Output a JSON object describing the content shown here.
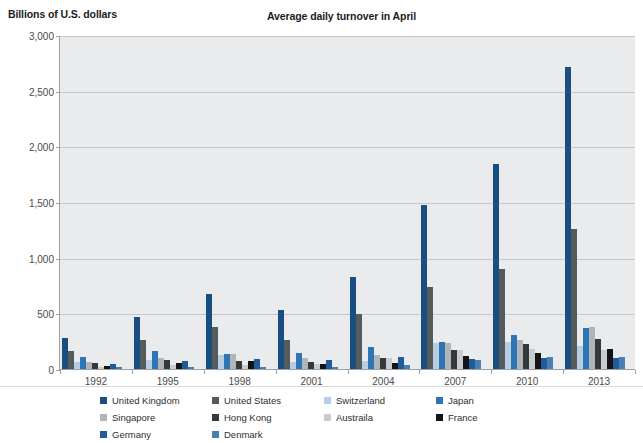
{
  "header": {
    "y_axis_title": "Billions of U.S. dollars",
    "chart_title": "Average daily turnover in April"
  },
  "chart_data": {
    "type": "bar",
    "title": "Average daily turnover in April",
    "xlabel": "",
    "ylabel": "Billions of U.S. dollars",
    "ylim": [
      0,
      3000
    ],
    "yticks": [
      "0",
      "500",
      "1,000",
      "1,500",
      "2,000",
      "2,500",
      "3,000"
    ],
    "ytick_values": [
      0,
      500,
      1000,
      1500,
      2000,
      2500,
      3000
    ],
    "grid": true,
    "legend_position": "bottom",
    "categories": [
      "1992",
      "1995",
      "1998",
      "2001",
      "2004",
      "2007",
      "2010",
      "2013"
    ],
    "series": [
      {
        "name": "United Kingdom",
        "color": "#1a4d80",
        "values": [
          291,
          479,
          685,
          542,
          835,
          1483,
          1854,
          2726
        ]
      },
      {
        "name": "United States",
        "color": "#555a5e",
        "values": [
          167,
          266,
          383,
          273,
          499,
          745,
          904,
          1263
        ]
      },
      {
        "name": "Switzerland",
        "color": "#b9cde0",
        "values": [
          68,
          92,
          139,
          76,
          79,
          242,
          249,
          216
        ]
      },
      {
        "name": "Japan",
        "color": "#2e75b6",
        "values": [
          120,
          168,
          146,
          153,
          207,
          250,
          312,
          374
        ]
      },
      {
        "name": "Singapore",
        "color": "#b2b5b8",
        "values": [
          76,
          107,
          145,
          104,
          134,
          242,
          266,
          383
        ]
      },
      {
        "name": "Hong Kong",
        "color": "#36393c",
        "values": [
          61,
          91,
          80,
          68,
          106,
          181,
          238,
          275
        ]
      },
      {
        "name": "Austraila",
        "color": "#c9ccce",
        "values": [
          30,
          41,
          48,
          54,
          107,
          176,
          192,
          182
        ]
      },
      {
        "name": "France",
        "color": "#121415",
        "values": [
          36,
          62,
          78,
          50,
          67,
          127,
          152,
          190
        ]
      },
      {
        "name": "Germany",
        "color": "#1f5c99",
        "values": [
          57,
          79,
          100,
          91,
          120,
          101,
          109,
          111
        ]
      },
      {
        "name": "Denmark",
        "color": "#4a7fb5",
        "values": [
          31,
          31,
          28,
          24,
          42,
          88,
          120,
          117
        ]
      }
    ]
  },
  "legend": {
    "items": [
      {
        "label": "United Kingdom",
        "color": "#1a4d80"
      },
      {
        "label": "United States",
        "color": "#555a5e"
      },
      {
        "label": "Switzerland",
        "color": "#b9cde0"
      },
      {
        "label": "Japan",
        "color": "#2e75b6"
      },
      {
        "label": "Singapore",
        "color": "#b2b5b8"
      },
      {
        "label": "Hong Kong",
        "color": "#36393c"
      },
      {
        "label": "Austraila",
        "color": "#c9ccce"
      },
      {
        "label": "France",
        "color": "#121415"
      },
      {
        "label": "Germany",
        "color": "#1f5c99"
      },
      {
        "label": "Denmark",
        "color": "#4a7fb5"
      }
    ]
  }
}
